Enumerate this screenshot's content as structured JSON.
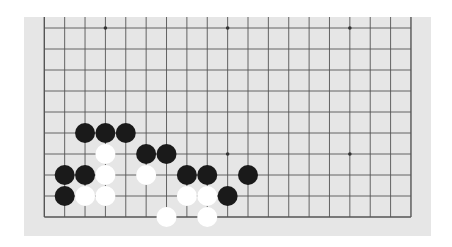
{
  "board": {
    "size": 19,
    "visible_rows": [
      10,
      19
    ],
    "visible_cols": [
      1,
      19
    ],
    "background": "#e6e6e6",
    "line_color": "#555555",
    "origin": {
      "x": 20.3,
      "y": 11
    },
    "spacing": {
      "x": 20.37,
      "y": 21.0
    },
    "cols": 19,
    "rows": 10,
    "open_top": true,
    "star_points": [
      {
        "col": 3,
        "row": 0
      },
      {
        "col": 9,
        "row": 0
      },
      {
        "col": 15,
        "row": 0
      },
      {
        "col": 3,
        "row": 6
      },
      {
        "col": 9,
        "row": 6
      },
      {
        "col": 15,
        "row": 6
      }
    ]
  },
  "stones": [
    {
      "color": "black",
      "col": 2,
      "row": 5
    },
    {
      "color": "black",
      "col": 3,
      "row": 5
    },
    {
      "color": "black",
      "col": 4,
      "row": 5
    },
    {
      "color": "white",
      "col": 3,
      "row": 6
    },
    {
      "color": "black",
      "col": 5,
      "row": 6
    },
    {
      "color": "black",
      "col": 6,
      "row": 6
    },
    {
      "color": "black",
      "col": 1,
      "row": 7
    },
    {
      "color": "black",
      "col": 2,
      "row": 7
    },
    {
      "color": "white",
      "col": 3,
      "row": 7
    },
    {
      "color": "white",
      "col": 5,
      "row": 7
    },
    {
      "color": "black",
      "col": 7,
      "row": 7
    },
    {
      "color": "black",
      "col": 8,
      "row": 7
    },
    {
      "color": "black",
      "col": 10,
      "row": 7
    },
    {
      "color": "black",
      "col": 1,
      "row": 8
    },
    {
      "color": "white",
      "col": 2,
      "row": 8
    },
    {
      "color": "white",
      "col": 3,
      "row": 8
    },
    {
      "color": "white",
      "col": 7,
      "row": 8
    },
    {
      "color": "white",
      "col": 8,
      "row": 8
    },
    {
      "color": "black",
      "col": 9,
      "row": 8
    },
    {
      "color": "white",
      "col": 6,
      "row": 9
    },
    {
      "color": "white",
      "col": 8,
      "row": 9
    }
  ],
  "colors": {
    "black_stone": "#1a1a1a",
    "white_stone": "#ffffff"
  }
}
